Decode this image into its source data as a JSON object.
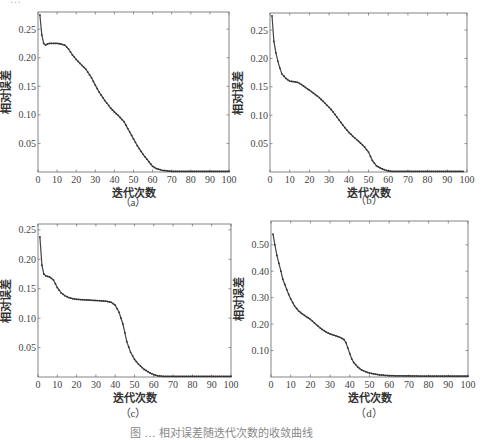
{
  "figure": {
    "top_text_partial": "…",
    "bottom_caption_partial": "图 … 相对误差随迭代次数的收敛曲线"
  },
  "chart_data": [
    {
      "id": "a",
      "type": "line",
      "subcaption": "（a）",
      "xlabel": "迭代次数",
      "ylabel": "相对误差",
      "xlim": [
        0,
        100
      ],
      "ylim": [
        0,
        0.28
      ],
      "xticks": [
        0,
        10,
        20,
        30,
        40,
        50,
        60,
        70,
        80,
        90,
        100
      ],
      "yticks": [
        0.05,
        0.1,
        0.15,
        0.2,
        0.25
      ],
      "ytick_labels": [
        "0.05",
        "0.10",
        "0.15",
        "0.20",
        "0.25"
      ],
      "grid": false,
      "x": [
        1,
        2,
        3,
        4,
        5,
        6,
        8,
        10,
        12,
        14,
        16,
        18,
        20,
        22,
        25,
        28,
        30,
        32,
        35,
        38,
        40,
        42,
        45,
        48,
        50,
        52,
        55,
        58,
        60,
        62,
        65,
        70,
        80,
        90,
        100
      ],
      "values": [
        0.275,
        0.24,
        0.225,
        0.222,
        0.224,
        0.225,
        0.225,
        0.225,
        0.224,
        0.222,
        0.215,
        0.205,
        0.197,
        0.19,
        0.18,
        0.165,
        0.152,
        0.14,
        0.125,
        0.112,
        0.105,
        0.099,
        0.088,
        0.07,
        0.058,
        0.046,
        0.031,
        0.018,
        0.01,
        0.006,
        0.003,
        0.001,
        0.001,
        0.001,
        0.001
      ]
    },
    {
      "id": "b",
      "type": "line",
      "subcaption": "（b）",
      "xlabel": "迭代次数",
      "ylabel": "相对误差",
      "xlim": [
        0,
        100
      ],
      "ylim": [
        0,
        0.28
      ],
      "xticks": [
        0,
        10,
        20,
        30,
        40,
        50,
        60,
        70,
        80,
        90,
        100
      ],
      "yticks": [
        0.05,
        0.1,
        0.15,
        0.2,
        0.25
      ],
      "ytick_labels": [
        "0.05",
        "0.10",
        "0.15",
        "0.20",
        "0.25"
      ],
      "grid": false,
      "x": [
        1,
        2,
        3,
        4,
        5,
        6,
        8,
        10,
        12,
        14,
        16,
        18,
        20,
        22,
        25,
        28,
        30,
        32,
        35,
        38,
        40,
        42,
        45,
        48,
        50,
        52,
        54,
        56,
        58,
        60,
        62,
        65,
        70,
        80,
        90,
        98
      ],
      "values": [
        0.275,
        0.23,
        0.21,
        0.195,
        0.183,
        0.173,
        0.165,
        0.16,
        0.159,
        0.158,
        0.154,
        0.149,
        0.144,
        0.139,
        0.131,
        0.121,
        0.114,
        0.106,
        0.092,
        0.078,
        0.07,
        0.063,
        0.054,
        0.044,
        0.035,
        0.02,
        0.011,
        0.007,
        0.004,
        0.002,
        0.001,
        0.001,
        0.001,
        0.001,
        0.001,
        0.001
      ]
    },
    {
      "id": "c",
      "type": "line",
      "subcaption": "（c）",
      "xlabel": "迭代次数",
      "ylabel": "相对误差",
      "xlim": [
        0,
        100
      ],
      "ylim": [
        0,
        0.26
      ],
      "xticks": [
        0,
        10,
        20,
        30,
        40,
        50,
        60,
        70,
        80,
        90,
        100
      ],
      "yticks": [
        0.05,
        0.1,
        0.15,
        0.2,
        0.25
      ],
      "ytick_labels": [
        "0.05",
        "0.10",
        "0.15",
        "0.20",
        "0.25"
      ],
      "grid": false,
      "x": [
        1,
        2,
        3,
        4,
        6,
        8,
        10,
        12,
        14,
        16,
        18,
        20,
        25,
        30,
        35,
        38,
        40,
        42,
        44,
        45,
        46,
        48,
        50,
        52,
        55,
        58,
        60,
        62,
        65,
        70,
        80,
        90,
        100
      ],
      "values": [
        0.238,
        0.19,
        0.175,
        0.172,
        0.17,
        0.165,
        0.152,
        0.143,
        0.138,
        0.135,
        0.133,
        0.132,
        0.131,
        0.13,
        0.129,
        0.127,
        0.122,
        0.11,
        0.09,
        0.075,
        0.06,
        0.042,
        0.03,
        0.022,
        0.013,
        0.007,
        0.004,
        0.002,
        0.001,
        0.001,
        0.001,
        0.001,
        0.001
      ]
    },
    {
      "id": "d",
      "type": "line",
      "subcaption": "（d）",
      "xlabel": "迭代次数",
      "ylabel": "相对误差",
      "xlim": [
        0,
        100
      ],
      "ylim": [
        0,
        0.59
      ],
      "xticks": [
        0,
        10,
        20,
        30,
        40,
        50,
        60,
        70,
        80,
        90,
        100
      ],
      "yticks": [
        0.1,
        0.2,
        0.3,
        0.4,
        0.5
      ],
      "ytick_labels": [
        "0.10",
        "0.20",
        "0.30",
        "0.40",
        "0.50"
      ],
      "grid": false,
      "x": [
        1,
        2,
        3,
        4,
        5,
        6,
        8,
        10,
        12,
        14,
        16,
        18,
        20,
        22,
        25,
        28,
        30,
        32,
        35,
        37,
        38,
        39,
        40,
        41,
        42,
        44,
        46,
        48,
        50,
        55,
        60,
        70,
        80,
        90,
        100
      ],
      "values": [
        0.54,
        0.5,
        0.46,
        0.43,
        0.4,
        0.37,
        0.33,
        0.295,
        0.268,
        0.25,
        0.238,
        0.228,
        0.218,
        0.205,
        0.185,
        0.17,
        0.163,
        0.158,
        0.15,
        0.142,
        0.13,
        0.11,
        0.088,
        0.068,
        0.055,
        0.038,
        0.027,
        0.02,
        0.015,
        0.008,
        0.005,
        0.004,
        0.003,
        0.003,
        0.003
      ]
    }
  ]
}
